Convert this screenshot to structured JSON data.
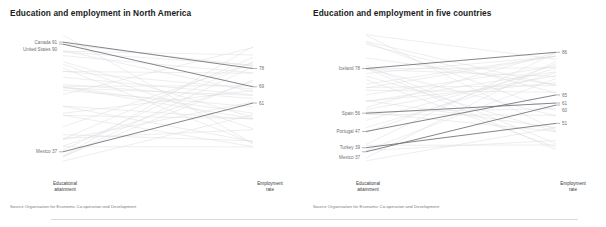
{
  "charts": [
    {
      "title": "Education and employment in North America",
      "axis_left": "Educational\nattainment",
      "axis_left_line1": "Educational",
      "axis_left_line2": "attainment",
      "axis_right_line1": "Employment",
      "axis_right_line2": "rate",
      "source": "Source Organisation for Economic Co-operation and Development"
    },
    {
      "title": "Education and employment in five countries",
      "axis_left_line1": "Educational",
      "axis_left_line2": "attainment",
      "axis_right_line1": "Employment",
      "axis_right_line2": "rate",
      "source": "Source Organisation for Economic Co-operation and Development"
    }
  ],
  "chart_data": [
    {
      "type": "line",
      "subtype": "slopegraph",
      "title": "Education and employment in North America",
      "xlabel": "",
      "ylabel": "",
      "x": [
        "Educational attainment",
        "Employment rate"
      ],
      "ylim": [
        30,
        95
      ],
      "grid": false,
      "legend": "none",
      "highlight_color": "#6e6e76",
      "background_color": "#dcdce0",
      "highlighted_series": [
        {
          "name": "Canada",
          "left_label": "Canada 91",
          "right_label": "78",
          "values": [
            91,
            78
          ]
        },
        {
          "name": "United States",
          "left_label": "United States 90",
          "right_label": "69",
          "values": [
            90,
            69
          ]
        },
        {
          "name": "Mexico",
          "left_label": "Mexico 37",
          "right_label": "61",
          "values": [
            37,
            61
          ]
        }
      ],
      "background_series_count": 36,
      "notes": "Grey background lines are all other OECD countries; three North American countries highlighted in dark grey."
    },
    {
      "type": "line",
      "subtype": "slopegraph",
      "title": "Education and employment in five countries",
      "xlabel": "",
      "ylabel": "",
      "x": [
        "Educational attainment",
        "Employment rate"
      ],
      "ylim": [
        30,
        95
      ],
      "grid": false,
      "legend": "none",
      "highlight_color": "#6e6e76",
      "background_color": "#dcdce0",
      "highlighted_series": [
        {
          "name": "Iceland",
          "left_label": "Iceland 78",
          "right_label": "86",
          "values": [
            78,
            86
          ]
        },
        {
          "name": "Spain",
          "left_label": "Spain 56",
          "right_label": "61",
          "values": [
            56,
            61
          ]
        },
        {
          "name": "Portugal",
          "left_label": "Portugal 47",
          "right_label": "65",
          "values": [
            47,
            65
          ]
        },
        {
          "name": "Turkey",
          "left_label": "Turkey 39",
          "right_label": "51",
          "values": [
            39,
            51
          ]
        },
        {
          "name": "Mexico",
          "left_label": "Mexico 37",
          "right_label": "60",
          "values": [
            37,
            60
          ]
        }
      ],
      "background_series_count": 36,
      "notes": "Grey background lines are all other OECD countries; five selected countries highlighted in dark grey."
    }
  ]
}
